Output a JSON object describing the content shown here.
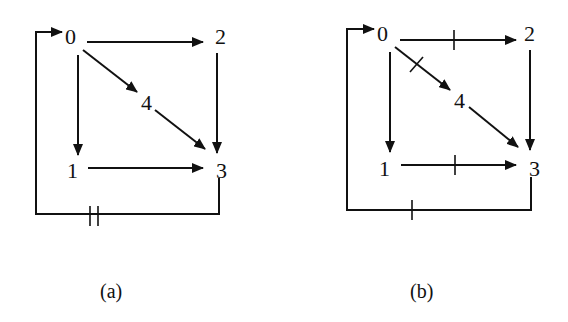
{
  "figures": [
    {
      "id": "a",
      "caption": "(a)",
      "nodes": [
        {
          "id": "0",
          "label": "0"
        },
        {
          "id": "1",
          "label": "1"
        },
        {
          "id": "2",
          "label": "2"
        },
        {
          "id": "3",
          "label": "3"
        },
        {
          "id": "4",
          "label": "4"
        }
      ],
      "edges": [
        {
          "from": "0",
          "to": "2",
          "delay_marks": 0
        },
        {
          "from": "0",
          "to": "1",
          "delay_marks": 0
        },
        {
          "from": "0",
          "to": "4",
          "delay_marks": 0
        },
        {
          "from": "4",
          "to": "3",
          "delay_marks": 0
        },
        {
          "from": "2",
          "to": "3",
          "delay_marks": 0
        },
        {
          "from": "1",
          "to": "3",
          "delay_marks": 0
        },
        {
          "from": "3",
          "to": "0",
          "delay_marks": 2
        }
      ]
    },
    {
      "id": "b",
      "caption": "(b)",
      "nodes": [
        {
          "id": "0",
          "label": "0"
        },
        {
          "id": "1",
          "label": "1"
        },
        {
          "id": "2",
          "label": "2"
        },
        {
          "id": "3",
          "label": "3"
        },
        {
          "id": "4",
          "label": "4"
        }
      ],
      "edges": [
        {
          "from": "0",
          "to": "2",
          "delay_marks": 1
        },
        {
          "from": "0",
          "to": "1",
          "delay_marks": 0
        },
        {
          "from": "0",
          "to": "4",
          "delay_marks": 1
        },
        {
          "from": "4",
          "to": "3",
          "delay_marks": 0
        },
        {
          "from": "2",
          "to": "3",
          "delay_marks": 0
        },
        {
          "from": "1",
          "to": "3",
          "delay_marks": 1
        },
        {
          "from": "3",
          "to": "0",
          "delay_marks": 1
        }
      ]
    }
  ]
}
